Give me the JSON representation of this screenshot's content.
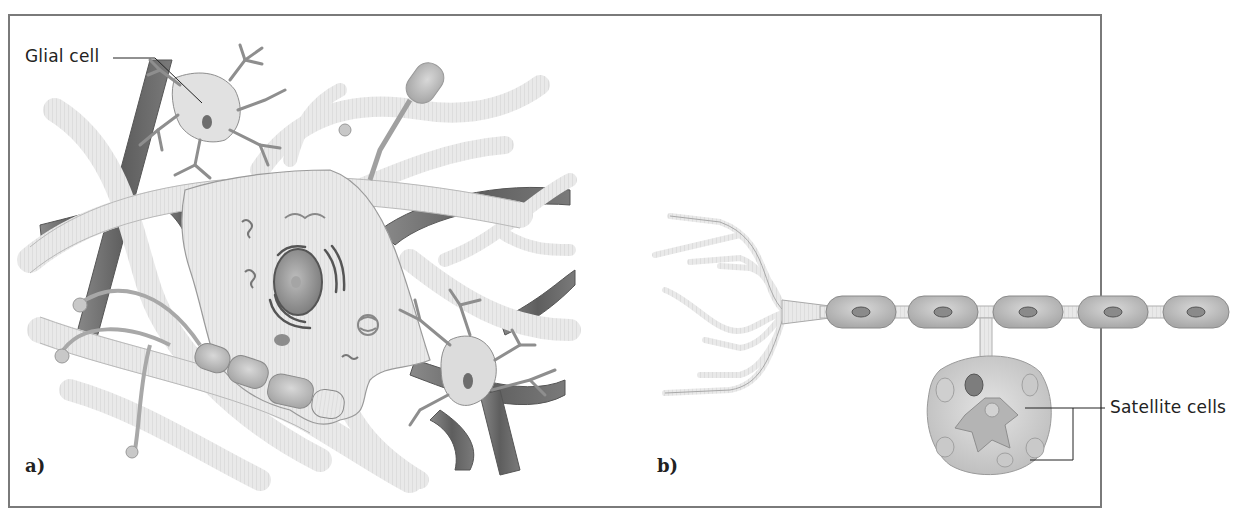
{
  "figure": {
    "panels": [
      {
        "id": "a",
        "tag": "a)",
        "subject": "Neuron cell body in central nervous system surrounded by glial cells and blood vessels"
      },
      {
        "id": "b",
        "tag": "b)",
        "subject": "Peripheral neuron with myelinated axon and cell body enclosed by satellite cells"
      }
    ],
    "labels": {
      "glial_cell": "Glial cell",
      "satellite_cells": "Satellite cells"
    },
    "colors": {
      "frame": "#7a7a7a",
      "tissue_light": "#e6e6e6",
      "tissue_mid": "#cfcfcf",
      "vessel_dark": "#6e6e6e",
      "organelle": "#7d7d7d",
      "leader_line": "#222222"
    }
  }
}
